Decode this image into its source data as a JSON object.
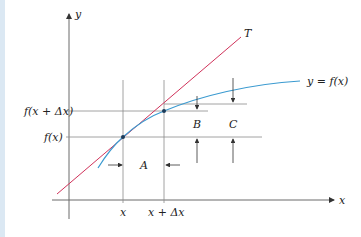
{
  "diagram": {
    "colors": {
      "axis": "#6b6b6b",
      "grid": "#8a8a8a",
      "curve": "#3a9ad0",
      "tangent": "#d0325a",
      "strip": "#dbe8f3",
      "text": "#222222"
    },
    "labels": {
      "y_axis": "y",
      "x_axis": "x",
      "tangent": "T",
      "curve": "y = f(x)",
      "f_x": "f(x)",
      "f_x_dx": "f(x + Δx)",
      "x_tick": "x",
      "x_dx_tick": "x + Δx",
      "region_a": "A",
      "region_b": "B",
      "region_c": "C"
    },
    "points": [
      {
        "name": "point-x",
        "x": 123,
        "y": 137
      },
      {
        "name": "point-x-dx",
        "x": 164,
        "y": 111
      }
    ]
  }
}
